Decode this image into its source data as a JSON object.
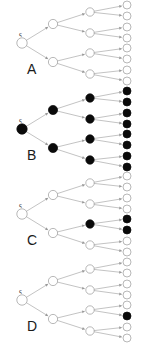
{
  "figure": {
    "width": 145,
    "height": 343,
    "background_color": "#ffffff",
    "node_open_fill": "#ffffff",
    "node_filled_fill": "#0a0a0a",
    "node_stroke_color": "#9a9a9a",
    "edge_color": "#9a9a9a",
    "label_color": "#1a1a1a",
    "root_glyph": "ς"
  },
  "panels": [
    {
      "label": "A",
      "label_x": 27,
      "label_y": 74,
      "y_offset": 0,
      "root": {
        "state": "open"
      },
      "level1": [
        {
          "state": "open"
        },
        {
          "state": "open"
        }
      ],
      "level2": [
        {
          "state": "open"
        },
        {
          "state": "open"
        },
        {
          "state": "open"
        },
        {
          "state": "open"
        }
      ],
      "leaves": [
        {
          "state": "open"
        },
        {
          "state": "open"
        },
        {
          "state": "open"
        },
        {
          "state": "open"
        },
        {
          "state": "open"
        },
        {
          "state": "open"
        },
        {
          "state": "open"
        },
        {
          "state": "open"
        }
      ]
    },
    {
      "label": "B",
      "label_x": 27,
      "label_y": 74,
      "y_offset": 86,
      "root": {
        "state": "filled"
      },
      "level1": [
        {
          "state": "filled"
        },
        {
          "state": "filled"
        }
      ],
      "level2": [
        {
          "state": "filled"
        },
        {
          "state": "filled"
        },
        {
          "state": "filled"
        },
        {
          "state": "filled"
        }
      ],
      "leaves": [
        {
          "state": "filled"
        },
        {
          "state": "filled"
        },
        {
          "state": "filled"
        },
        {
          "state": "filled"
        },
        {
          "state": "filled"
        },
        {
          "state": "filled"
        },
        {
          "state": "filled"
        },
        {
          "state": "filled"
        }
      ]
    },
    {
      "label": "C",
      "label_x": 27,
      "label_y": 74,
      "y_offset": 171,
      "root": {
        "state": "open"
      },
      "level1": [
        {
          "state": "open"
        },
        {
          "state": "open"
        }
      ],
      "level2": [
        {
          "state": "open"
        },
        {
          "state": "open"
        },
        {
          "state": "filled"
        },
        {
          "state": "open"
        }
      ],
      "leaves": [
        {
          "state": "open"
        },
        {
          "state": "open"
        },
        {
          "state": "open"
        },
        {
          "state": "open"
        },
        {
          "state": "filled"
        },
        {
          "state": "filled"
        },
        {
          "state": "open"
        },
        {
          "state": "open"
        }
      ]
    },
    {
      "label": "D",
      "label_x": 27,
      "label_y": 74,
      "y_offset": 257,
      "root": {
        "state": "open"
      },
      "level1": [
        {
          "state": "open"
        },
        {
          "state": "open"
        }
      ],
      "level2": [
        {
          "state": "open"
        },
        {
          "state": "open"
        },
        {
          "state": "open"
        },
        {
          "state": "open"
        }
      ],
      "leaves": [
        {
          "state": "open"
        },
        {
          "state": "open"
        },
        {
          "state": "open"
        },
        {
          "state": "open"
        },
        {
          "state": "open"
        },
        {
          "state": "filled"
        },
        {
          "state": "open"
        },
        {
          "state": "open"
        }
      ]
    }
  ],
  "geometry": {
    "panel_height": 86,
    "panel_width": 145,
    "col_x": [
      22,
      53,
      90,
      127
    ],
    "root_y": 43,
    "level1_y": [
      24,
      62
    ],
    "level2_y": [
      12,
      33,
      53,
      74
    ],
    "leaf_y": [
      5,
      16,
      27,
      38,
      48,
      59,
      70,
      81
    ],
    "node_r": [
      5.2,
      4.6,
      4.2,
      4.0
    ]
  }
}
